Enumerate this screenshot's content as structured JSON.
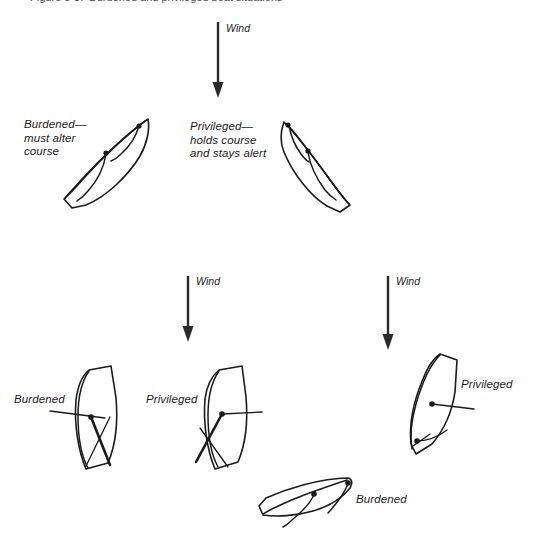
{
  "figure": {
    "background_color": "#ffffff",
    "ink_color": "#1a1a1a",
    "width": 536,
    "height": 552,
    "cut_off_caption": "Figure 5-3.  Burdened and privileged boat situations"
  },
  "wind_arrows": [
    {
      "id": "wind-top",
      "label": "Wind",
      "x": 218,
      "y_start": 22,
      "y_end": 96,
      "label_x": 226,
      "label_y": 26
    },
    {
      "id": "wind-middle",
      "label": "Wind",
      "x": 188,
      "y_start": 276,
      "y_end": 340,
      "label_x": 196,
      "label_y": 279
    },
    {
      "id": "wind-right",
      "label": "Wind",
      "x": 388,
      "y_start": 276,
      "y_end": 348,
      "label_x": 396,
      "label_y": 279
    }
  ],
  "scenarios": [
    {
      "id": "scenario-opposite-tacks",
      "name": "Opposite tacks — port gives way to starboard",
      "boats": [
        {
          "id": "boat-top-left",
          "role": "burdened",
          "label_lines": [
            "Burdened—",
            "must alter",
            "course"
          ],
          "label_x": 24,
          "label_y": 120
        },
        {
          "id": "boat-top-right",
          "role": "privileged",
          "label_lines": [
            "Privileged—",
            "holds course",
            "and stays alert"
          ],
          "label_x": 190,
          "label_y": 122
        }
      ]
    },
    {
      "id": "scenario-windward-leeward",
      "name": "Windward boat keeps clear of leeward boat",
      "boats": [
        {
          "id": "boat-mid-left",
          "role": "burdened",
          "label_lines": [
            "Burdened"
          ],
          "label_x": 14,
          "label_y": 396
        },
        {
          "id": "boat-mid-center",
          "role": "privileged",
          "label_lines": [
            "Privileged"
          ],
          "label_x": 147,
          "label_y": 396
        }
      ]
    },
    {
      "id": "scenario-overtaking",
      "name": "Overtaking boat keeps clear",
      "boats": [
        {
          "id": "boat-right-privileged",
          "role": "privileged",
          "label_lines": [
            "Privileged"
          ],
          "label_x": 461,
          "label_y": 383
        },
        {
          "id": "boat-bottom-burdened",
          "role": "burdened",
          "label_lines": [
            "Burdened"
          ],
          "label_x": 355,
          "label_y": 498
        }
      ]
    }
  ],
  "legend_terms": {
    "burdened": "Burdened",
    "privileged": "Privileged",
    "wind": "Wind"
  }
}
